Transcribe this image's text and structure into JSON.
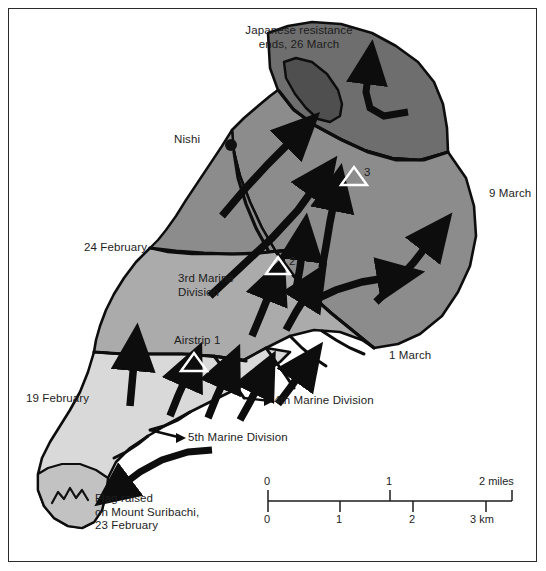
{
  "map": {
    "title": "Iwo Jima campaign advance map",
    "frame_color": "#2b2b2b",
    "background": "#ffffff",
    "zones": [
      {
        "name": "southern-sector-5th-division",
        "shade": "#d9d9d9"
      },
      {
        "name": "central-sector",
        "shade": "#b0b0b0"
      },
      {
        "name": "northern-sector",
        "shade": "#8c8c8c"
      },
      {
        "name": "far-northern-sector",
        "shade": "#6e6e6e"
      },
      {
        "name": "kitano-ridge",
        "shade": "#565656"
      }
    ]
  },
  "labels": {
    "japanese_resistance": "Japanese resistance\nends, 26 March",
    "nishi": "Nishi",
    "march_9": "9 March",
    "february_24": "24 February",
    "third_marine_division": "3rd Marine\nDivision",
    "airstrip_1": "Airstrip 1",
    "airstrip_2": "2",
    "airstrip_3": "3",
    "february_19": "19 February",
    "march_1": "1 March",
    "fourth_marine_division": "4th Marine Division",
    "fifth_marine_division": "5th Marine Division",
    "flag_raised": "Flag raised\non Mount Suribachi,\n23 February"
  },
  "scale_bar": {
    "miles_label": "2 miles",
    "miles_ticks": [
      "0",
      "1"
    ],
    "km_label": "3 km",
    "km_ticks": [
      "0",
      "1",
      "2"
    ],
    "miles_values": [
      0,
      1,
      2
    ],
    "km_values": [
      0,
      1,
      2,
      3
    ]
  },
  "symbols": {
    "airstrip_marker": "triangle-outline",
    "settlement_marker": "filled-dot",
    "mountain_marker": "mount-suribachi-glyph"
  }
}
